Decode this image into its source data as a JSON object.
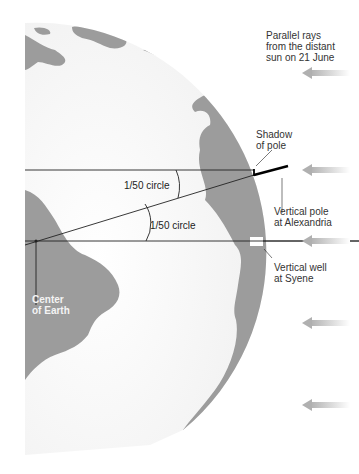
{
  "diagram": {
    "type": "Eratosthenes measurement of Earth circumference",
    "labels": {
      "rays": "Parallel rays\nfrom the distant\nsun on 21 June",
      "shadow": "Shadow\nof pole",
      "pole": "Vertical pole\nat Alexandria",
      "well": "Vertical well\nat Syene",
      "center": "Center\nof Earth",
      "angle_upper": "1/50 circle",
      "angle_lower": "1/50 circle"
    },
    "colors": {
      "ocean": "#f5f5f5",
      "land": "#9a9a9a",
      "line": "#222222",
      "arrow": "#bdbdbd",
      "text": "#333333"
    },
    "arrows_y": [
      73,
      170,
      240,
      323,
      405
    ]
  }
}
